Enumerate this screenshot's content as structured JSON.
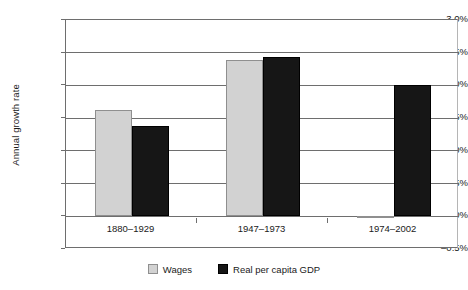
{
  "chart_data": {
    "type": "bar",
    "title": "",
    "subtitle": "",
    "xlabel": "",
    "ylabel": "Annual growth rate",
    "categories": [
      "1880–1929",
      "1947–1973",
      "1974–2002"
    ],
    "series": [
      {
        "name": "Wages",
        "color": "#d2d2d2",
        "values": [
          1.63,
          2.39,
          -0.03
        ]
      },
      {
        "name": "Real per capita GDP",
        "color": "#161616",
        "values": [
          1.38,
          2.44,
          2.0
        ]
      }
    ],
    "ylim": [
      -0.5,
      3.0
    ],
    "ytick_values": [
      3.0,
      2.5,
      2.0,
      1.5,
      1.0,
      0.5,
      0.0,
      -0.5
    ],
    "ytick_labels": [
      "3.0%",
      "2.5%",
      "2.0%",
      "1.5%",
      "1.0%",
      "0.5%",
      "0.0%",
      "–0.5%"
    ],
    "grid": true,
    "grid_axis": "y",
    "legend_position": "bottom",
    "value_unit": "percent",
    "bar_group_gap": true,
    "axis_color": "#6e6e6e",
    "background_color": "#ffffff"
  },
  "legend": {
    "entries": [
      {
        "label": "Wages",
        "swatch": "wages-swatch"
      },
      {
        "label": "Real per capita GDP",
        "swatch": "gdp-swatch"
      }
    ]
  }
}
